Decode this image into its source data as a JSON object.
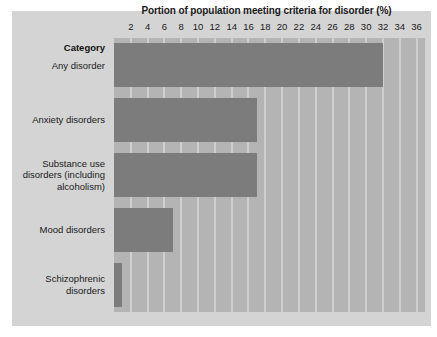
{
  "chart_data": {
    "type": "bar",
    "orientation": "horizontal",
    "title": "Portion of population meeting criteria for disorder (%)",
    "xlabel": "",
    "ylabel": "Category",
    "categories": [
      "Any disorder",
      "Anxiety disorders",
      "Substance use disorders (including alcoholism)",
      "Mood disorders",
      "Schizophrenic disorders"
    ],
    "category_lines": [
      [
        "Any disorder"
      ],
      [
        "Anxiety disorders"
      ],
      [
        "Substance use",
        "disorders (including",
        "alcoholism)"
      ],
      [
        "Mood disorders"
      ],
      [
        "Schizophrenic",
        "disorders"
      ]
    ],
    "values": [
      32,
      17,
      17,
      7,
      1
    ],
    "xlim": [
      0,
      37
    ],
    "xticks": [
      2,
      4,
      6,
      8,
      10,
      12,
      14,
      16,
      18,
      20,
      22,
      24,
      26,
      28,
      30,
      32,
      34,
      36
    ],
    "grid": true,
    "legend": "none",
    "colors": {
      "bar": "#7c7c7c",
      "plot_background": "#b4b4b4",
      "panel_background": "#d4d4d4",
      "gridline": "#cfcfcf",
      "text": "#1a1a1a",
      "figure_background": "#ffffff"
    }
  },
  "header": {
    "category_label": "Category"
  }
}
